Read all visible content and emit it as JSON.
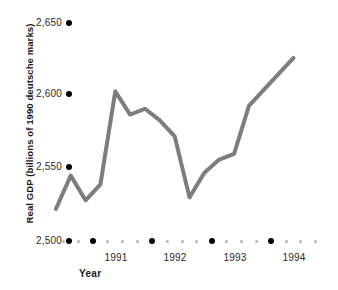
{
  "chart_data": {
    "type": "line",
    "title": "",
    "xlabel": "Year",
    "ylabel": "Real GDP (billions of 1990 deutsche marks)",
    "ylim": [
      2500,
      2650
    ],
    "y_ticks": [
      "2,500",
      "2,550",
      "2,600",
      "2,650"
    ],
    "y_tick_values": [
      2500,
      2550,
      2600,
      2650
    ],
    "x_ticks": [
      "1991",
      "1992",
      "1993",
      "1994"
    ],
    "x_tick_values": [
      1991,
      1992,
      1993,
      1994
    ],
    "grid": false,
    "legend": "none",
    "series": [
      {
        "name": "Real GDP",
        "color": "#7d7d7d",
        "x": [
          1990.375,
          1990.625,
          1990.875,
          1991.125,
          1991.375,
          1991.625,
          1991.875,
          1992.125,
          1992.375,
          1992.625,
          1992.875,
          1993.125,
          1993.375,
          1993.625,
          1993.875,
          1994.125,
          1994.375
        ],
        "x_labels": [
          "1990 Q2",
          "1990 Q3",
          "1990 Q4",
          "1991 Q1",
          "1991 Q2",
          "1991 Q3",
          "1991 Q4",
          "1992 Q1",
          "1992 Q2",
          "1992 Q3",
          "1992 Q4",
          "1993 Q1",
          "1993 Q2",
          "1993 Q3",
          "1993 Q4",
          "1994 Q1",
          "1994 Q2"
        ],
        "values": [
          2522,
          2545,
          2528,
          2539,
          2603,
          2587,
          2591,
          2583,
          2572,
          2530,
          2547,
          2556,
          2560,
          2593,
          2604,
          2615,
          2626
        ]
      }
    ]
  },
  "axis": {
    "y_title": "Real GDP (billions of 1990 deutsche marks)",
    "x_title": "Year"
  }
}
